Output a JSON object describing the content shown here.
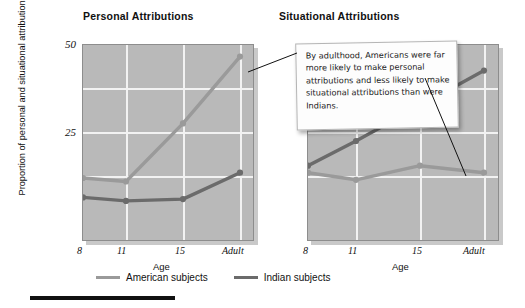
{
  "chart_data": [
    {
      "type": "line",
      "title": "Personal Attributions",
      "xlabel": "Age",
      "ylabel": "Proportion of personal and situational attributions",
      "categories": [
        "8",
        "11",
        "15",
        "Adult"
      ],
      "ylim": [
        0,
        50
      ],
      "yticks": [
        "25",
        "50"
      ],
      "grid": true,
      "legend_position": "bottom",
      "series": [
        {
          "name": "American subjects",
          "color": "#9a9a9a",
          "values": [
            12.5,
            11.5,
            28,
            47
          ]
        },
        {
          "name": "Indian subjects",
          "color": "#6b6b6b",
          "values": [
            7,
            6,
            6.5,
            14
          ]
        }
      ]
    },
    {
      "type": "line",
      "title": "Situational Attributions",
      "xlabel": "Age",
      "ylabel": "",
      "categories": [
        "8",
        "11",
        "15",
        "Adult"
      ],
      "ylim": [
        0,
        50
      ],
      "yticks": [],
      "grid": true,
      "legend_position": "bottom",
      "series": [
        {
          "name": "American subjects",
          "color": "#9a9a9a",
          "values": [
            14,
            12,
            16,
            14
          ]
        },
        {
          "name": "Indian subjects",
          "color": "#6b6b6b",
          "values": [
            16,
            23,
            33,
            43
          ]
        }
      ]
    }
  ],
  "titles": {
    "left": "Personal Attributions",
    "right": "Situational Attributions"
  },
  "axes": {
    "ylabel": "Proportion of personal and situational attributions",
    "xlabel_left": "Age",
    "xlabel_right": "Age",
    "ytick_50": "50",
    "ytick_25": "25",
    "xticks": [
      "8",
      "11",
      "15",
      "Adult"
    ]
  },
  "callout": {
    "text": "By adulthood, Americans were far more likely to make personal attributions and less likely to make situational attributions than were Indians."
  },
  "legend": {
    "items": [
      {
        "label": "American subjects",
        "color": "#9a9a9a"
      },
      {
        "label": "Indian subjects",
        "color": "#6b6b6b"
      }
    ]
  },
  "colors": {
    "plot_background": "#b9b9b9",
    "gridline": "#f2f2f2",
    "american": "#9a9a9a",
    "indian": "#6b6b6b"
  }
}
